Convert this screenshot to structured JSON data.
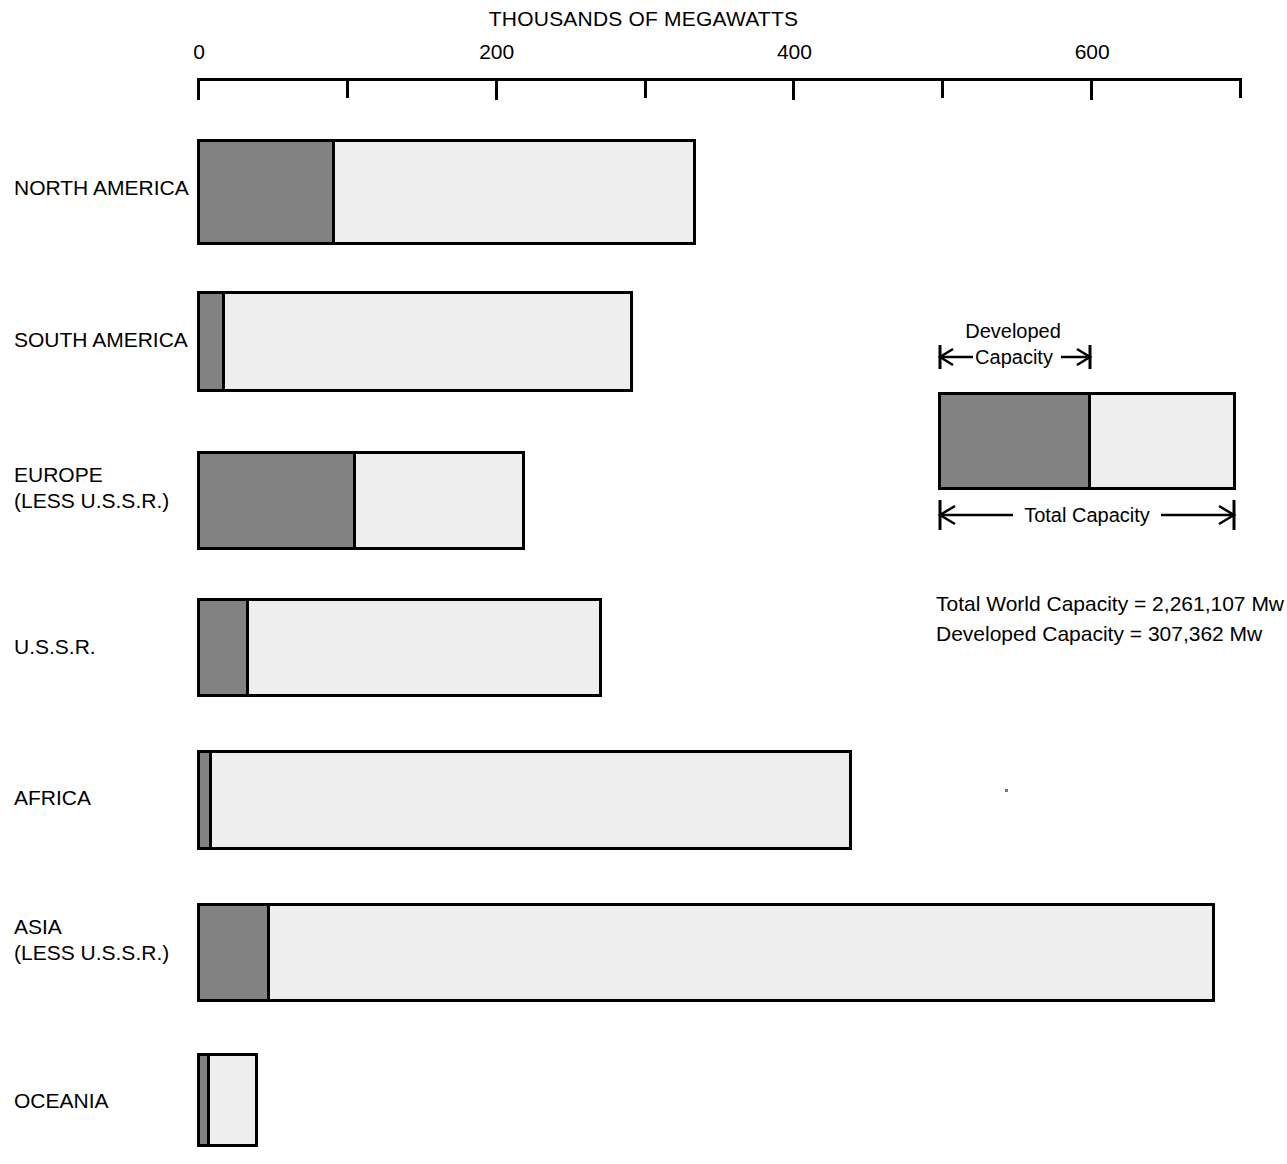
{
  "chart_data": {
    "type": "bar",
    "orientation": "horizontal",
    "stacked": true,
    "title": "THOUSANDS OF MEGAWATTS",
    "xlabel": "THOUSANDS OF MEGAWATTS",
    "ylabel": "",
    "xlim": [
      0,
      700
    ],
    "xticks": [
      0,
      100,
      200,
      300,
      400,
      500,
      600,
      700
    ],
    "xtick_labels": [
      "0",
      "",
      "200",
      "",
      "400",
      "",
      "600",
      ""
    ],
    "grid": false,
    "legend_position": "right-middle",
    "categories": [
      "NORTH AMERICA",
      "SOUTH AMERICA",
      "EUROPE\n(LESS U.S.S.R.)",
      "U.S.S.R.",
      "AFRICA",
      "ASIA\n(LESS U.S.S.R.)",
      "OCEANIA"
    ],
    "series": [
      {
        "name": "Developed Capacity",
        "color": "#828282",
        "values": [
          91,
          17,
          105,
          33,
          8,
          47,
          7
        ]
      },
      {
        "name": "Total Capacity",
        "color": "#eeeeee",
        "values": [
          333,
          291,
          218,
          270,
          438,
          682,
          39
        ]
      }
    ],
    "annotations": [
      "Total World Capacity = 2,261,107 Mw",
      "Developed Capacity = 307,362 Mw"
    ]
  },
  "axis": {
    "title": "THOUSANDS OF MEGAWATTS",
    "ticks": [
      {
        "value": 0,
        "label": "0"
      },
      {
        "value": 100,
        "label": ""
      },
      {
        "value": 200,
        "label": "200"
      },
      {
        "value": 300,
        "label": ""
      },
      {
        "value": 400,
        "label": "400"
      },
      {
        "value": 500,
        "label": ""
      },
      {
        "value": 600,
        "label": "600"
      },
      {
        "value": 700,
        "label": ""
      }
    ]
  },
  "bars": [
    {
      "label": "NORTH AMERICA",
      "developed": 91,
      "total": 333
    },
    {
      "label": "SOUTH AMERICA",
      "developed": 17,
      "total": 291
    },
    {
      "label": "EUROPE\n(LESS U.S.S.R.)",
      "developed": 105,
      "total": 218
    },
    {
      "label": "U.S.S.R.",
      "developed": 33,
      "total": 270
    },
    {
      "label": "AFRICA",
      "developed": 8,
      "total": 438
    },
    {
      "label": "ASIA\n(LESS U.S.S.R.)",
      "developed": 47,
      "total": 682
    },
    {
      "label": "OCEANIA",
      "developed": 7,
      "total": 39
    }
  ],
  "legend": {
    "developed_label": "Developed\nCapacity",
    "developed_label_line1": "Developed",
    "developed_label_line2": "Capacity",
    "total_label": "Total Capacity"
  },
  "totals": {
    "line1": "Total World Capacity  =  2,261,107 Mw",
    "line2": "Developed Capacity  =  307,362 Mw"
  },
  "colors": {
    "developed": "#828282",
    "undeveloped": "#eeeeee",
    "outline": "#000000",
    "background": "#ffffff"
  }
}
